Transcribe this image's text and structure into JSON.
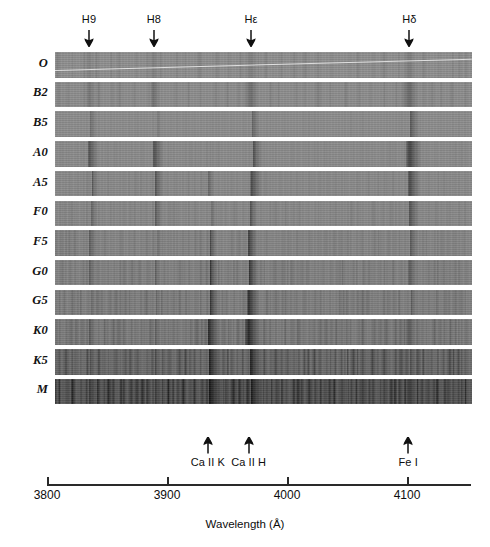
{
  "figure": {
    "background_color": "#ffffff",
    "ink_color": "#111111"
  },
  "axis": {
    "title": "Wavelength (Å)",
    "ticks": [
      {
        "label": "3800",
        "value": 3800
      },
      {
        "label": "3900",
        "value": 3900
      },
      {
        "label": "4000",
        "value": 4000
      },
      {
        "label": "4100",
        "value": 4100
      }
    ],
    "range_angstrom": [
      3795,
      4148
    ]
  },
  "top_markers": [
    {
      "label": "H9",
      "wavelength": 3835
    },
    {
      "label": "H8",
      "wavelength": 3889
    },
    {
      "label": "Hε",
      "wavelength": 3970
    },
    {
      "label": "Hδ",
      "wavelength": 4102
    }
  ],
  "bottom_markers": [
    {
      "label": "Ca II K",
      "wavelength": 3934
    },
    {
      "label": "Ca II H",
      "wavelength": 3968
    },
    {
      "label": "Fe I",
      "wavelength": 4101
    }
  ],
  "spectra": [
    {
      "label": "O",
      "base_gray": "#8f8f8f",
      "has_streak": true
    },
    {
      "label": "B2",
      "base_gray": "#8d8d8d",
      "has_streak": false
    },
    {
      "label": "B5",
      "base_gray": "#8d8d8d",
      "has_streak": false
    },
    {
      "label": "A0",
      "base_gray": "#8c8c8c",
      "has_streak": false
    },
    {
      "label": "A5",
      "base_gray": "#8b8b8b",
      "has_streak": false
    },
    {
      "label": "F0",
      "base_gray": "#8a8a8a",
      "has_streak": false
    },
    {
      "label": "F5",
      "base_gray": "#878787",
      "has_streak": false
    },
    {
      "label": "G0",
      "base_gray": "#848484",
      "has_streak": false
    },
    {
      "label": "G5",
      "base_gray": "#828282",
      "has_streak": false
    },
    {
      "label": "K0",
      "base_gray": "#7e7e7e",
      "has_streak": false
    },
    {
      "label": "K5",
      "base_gray": "#6e6e6e",
      "has_streak": false
    },
    {
      "label": "M",
      "base_gray": "#5a5a5a",
      "has_streak": false
    }
  ],
  "chart_data": {
    "type": "heatmap",
    "title": "",
    "xlabel": "Wavelength (Å)",
    "ylabel": "",
    "xlim": [
      3795,
      4148
    ],
    "grid": false,
    "legend": "none",
    "categories": [
      "O",
      "B2",
      "B5",
      "A0",
      "A5",
      "F0",
      "F5",
      "G0",
      "G5",
      "K0",
      "K5",
      "M"
    ],
    "annotations_top": [
      "H9",
      "H8",
      "Hε",
      "Hδ"
    ],
    "annotations_bottom": [
      "Ca II K",
      "Ca II H",
      "Fe I"
    ],
    "series": [
      {
        "name": "O",
        "mean_gray_level": 0.56,
        "lines": [
          {
            "wavelength": 3835,
            "depth": 0.1,
            "width": 5
          },
          {
            "wavelength": 3889,
            "depth": 0.11,
            "width": 5
          },
          {
            "wavelength": 3970,
            "depth": 0.12,
            "width": 6
          },
          {
            "wavelength": 4102,
            "depth": 0.14,
            "width": 6
          },
          {
            "wavelength": 4026,
            "depth": 0.07,
            "width": 3
          },
          {
            "wavelength": 4144,
            "depth": 0.06,
            "width": 3
          }
        ]
      },
      {
        "name": "B2",
        "mean_gray_level": 0.555,
        "lines": [
          {
            "wavelength": 3835,
            "depth": 0.18,
            "width": 6
          },
          {
            "wavelength": 3889,
            "depth": 0.2,
            "width": 6
          },
          {
            "wavelength": 3970,
            "depth": 0.23,
            "width": 7
          },
          {
            "wavelength": 4102,
            "depth": 0.27,
            "width": 8
          },
          {
            "wavelength": 4026,
            "depth": 0.1,
            "width": 4
          },
          {
            "wavelength": 4121,
            "depth": 0.07,
            "width": 3
          }
        ]
      },
      {
        "name": "B5",
        "mean_gray_level": 0.55,
        "lines": [
          {
            "wavelength": 3835,
            "depth": 0.26,
            "width": 7
          },
          {
            "wavelength": 3889,
            "depth": 0.29,
            "width": 7
          },
          {
            "wavelength": 3970,
            "depth": 0.33,
            "width": 8
          },
          {
            "wavelength": 4102,
            "depth": 0.38,
            "width": 9
          },
          {
            "wavelength": 4026,
            "depth": 0.11,
            "width": 4
          },
          {
            "wavelength": 3934,
            "depth": 0.06,
            "width": 3
          }
        ]
      },
      {
        "name": "A0",
        "mean_gray_level": 0.545,
        "lines": [
          {
            "wavelength": 3835,
            "depth": 0.42,
            "width": 9
          },
          {
            "wavelength": 3889,
            "depth": 0.45,
            "width": 9
          },
          {
            "wavelength": 3970,
            "depth": 0.48,
            "width": 10
          },
          {
            "wavelength": 4102,
            "depth": 0.52,
            "width": 11
          },
          {
            "wavelength": 3934,
            "depth": 0.12,
            "width": 4
          }
        ]
      },
      {
        "name": "A5",
        "mean_gray_level": 0.54,
        "lines": [
          {
            "wavelength": 3835,
            "depth": 0.4,
            "width": 9
          },
          {
            "wavelength": 3889,
            "depth": 0.43,
            "width": 9
          },
          {
            "wavelength": 3934,
            "depth": 0.3,
            "width": 6
          },
          {
            "wavelength": 3970,
            "depth": 0.48,
            "width": 10
          },
          {
            "wavelength": 4102,
            "depth": 0.48,
            "width": 10
          },
          {
            "wavelength": 4046,
            "depth": 0.08,
            "width": 3
          }
        ]
      },
      {
        "name": "F0",
        "mean_gray_level": 0.535,
        "lines": [
          {
            "wavelength": 3835,
            "depth": 0.36,
            "width": 8
          },
          {
            "wavelength": 3889,
            "depth": 0.4,
            "width": 8
          },
          {
            "wavelength": 3934,
            "depth": 0.44,
            "width": 7
          },
          {
            "wavelength": 3968,
            "depth": 0.46,
            "width": 8
          },
          {
            "wavelength": 4102,
            "depth": 0.42,
            "width": 9
          },
          {
            "wavelength": 4046,
            "depth": 0.1,
            "width": 3
          },
          {
            "wavelength": 4072,
            "depth": 0.09,
            "width": 3
          }
        ]
      },
      {
        "name": "F5",
        "mean_gray_level": 0.525,
        "lines": [
          {
            "wavelength": 3835,
            "depth": 0.34,
            "width": 7
          },
          {
            "wavelength": 3889,
            "depth": 0.38,
            "width": 7
          },
          {
            "wavelength": 3934,
            "depth": 0.54,
            "width": 8
          },
          {
            "wavelength": 3968,
            "depth": 0.54,
            "width": 8
          },
          {
            "wavelength": 4102,
            "depth": 0.36,
            "width": 8
          },
          {
            "wavelength": 4046,
            "depth": 0.14,
            "width": 3
          },
          {
            "wavelength": 4226,
            "depth": 0.1,
            "width": 3
          }
        ]
      },
      {
        "name": "G0",
        "mean_gray_level": 0.515,
        "lines": [
          {
            "wavelength": 3835,
            "depth": 0.3,
            "width": 6
          },
          {
            "wavelength": 3889,
            "depth": 0.33,
            "width": 6
          },
          {
            "wavelength": 3934,
            "depth": 0.62,
            "width": 9
          },
          {
            "wavelength": 3968,
            "depth": 0.6,
            "width": 9
          },
          {
            "wavelength": 4102,
            "depth": 0.32,
            "width": 7
          },
          {
            "wavelength": 4046,
            "depth": 0.16,
            "width": 3
          },
          {
            "wavelength": 4071,
            "depth": 0.15,
            "width": 3
          }
        ]
      },
      {
        "name": "G5",
        "mean_gray_level": 0.505,
        "lines": [
          {
            "wavelength": 3835,
            "depth": 0.3,
            "width": 6
          },
          {
            "wavelength": 3889,
            "depth": 0.32,
            "width": 6
          },
          {
            "wavelength": 3934,
            "depth": 0.66,
            "width": 10
          },
          {
            "wavelength": 3968,
            "depth": 0.64,
            "width": 10
          },
          {
            "wavelength": 4102,
            "depth": 0.3,
            "width": 7
          },
          {
            "wavelength": 4046,
            "depth": 0.18,
            "width": 3
          },
          {
            "wavelength": 4063,
            "depth": 0.17,
            "width": 3
          }
        ]
      },
      {
        "name": "K0",
        "mean_gray_level": 0.49,
        "lines": [
          {
            "wavelength": 3835,
            "depth": 0.3,
            "width": 6
          },
          {
            "wavelength": 3889,
            "depth": 0.32,
            "width": 6
          },
          {
            "wavelength": 3934,
            "depth": 0.7,
            "width": 11
          },
          {
            "wavelength": 3968,
            "depth": 0.68,
            "width": 11
          },
          {
            "wavelength": 4102,
            "depth": 0.3,
            "width": 6
          },
          {
            "wavelength": 4046,
            "depth": 0.22,
            "width": 3
          },
          {
            "wavelength": 4063,
            "depth": 0.21,
            "width": 3
          },
          {
            "wavelength": 4144,
            "depth": 0.2,
            "width": 3
          }
        ]
      },
      {
        "name": "K5",
        "mean_gray_level": 0.43,
        "lines": [
          {
            "wavelength": 3835,
            "depth": 0.34,
            "width": 6
          },
          {
            "wavelength": 3889,
            "depth": 0.36,
            "width": 6
          },
          {
            "wavelength": 3934,
            "depth": 0.74,
            "width": 12
          },
          {
            "wavelength": 3968,
            "depth": 0.72,
            "width": 12
          },
          {
            "wavelength": 4102,
            "depth": 0.32,
            "width": 6
          },
          {
            "wavelength": 4046,
            "depth": 0.28,
            "width": 4
          },
          {
            "wavelength": 4063,
            "depth": 0.27,
            "width": 4
          },
          {
            "wavelength": 4144,
            "depth": 0.26,
            "width": 4
          }
        ]
      },
      {
        "name": "M",
        "mean_gray_level": 0.35,
        "lines": [
          {
            "wavelength": 3835,
            "depth": 0.4,
            "width": 7
          },
          {
            "wavelength": 3889,
            "depth": 0.42,
            "width": 7
          },
          {
            "wavelength": 3934,
            "depth": 0.76,
            "width": 13
          },
          {
            "wavelength": 3968,
            "depth": 0.74,
            "width": 13
          },
          {
            "wavelength": 4102,
            "depth": 0.38,
            "width": 7
          },
          {
            "wavelength": 4046,
            "depth": 0.34,
            "width": 5
          },
          {
            "wavelength": 4063,
            "depth": 0.33,
            "width": 5
          },
          {
            "wavelength": 4144,
            "depth": 0.32,
            "width": 5
          }
        ]
      }
    ]
  }
}
